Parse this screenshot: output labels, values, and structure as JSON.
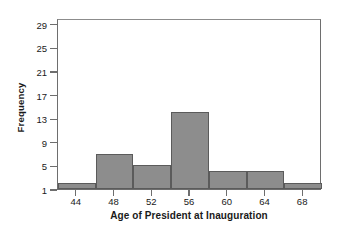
{
  "chart_data": {
    "type": "bar",
    "title": "",
    "xlabel": "Age of President at Inauguration",
    "ylabel": "Frequency",
    "bin_width": 4,
    "bin_edges": [
      42,
      46,
      50,
      54,
      58,
      62,
      66,
      70
    ],
    "categories": [
      "42-46",
      "46-50",
      "50-54",
      "54-58",
      "58-62",
      "62-66",
      "66-70"
    ],
    "bin_centers": [
      44,
      48,
      52,
      56,
      60,
      64,
      68
    ],
    "values": [
      2,
      7,
      5,
      14,
      4,
      4,
      2
    ],
    "xlim": [
      42,
      70
    ],
    "ylim": [
      1,
      30
    ],
    "xticks": [
      44,
      48,
      52,
      56,
      60,
      64,
      68
    ],
    "xtick_labels": [
      "44",
      "48",
      "52",
      "56",
      "60",
      "64",
      "68"
    ],
    "yticks": [
      1,
      5,
      9,
      13,
      17,
      21,
      25,
      29
    ],
    "ytick_labels": [
      "1",
      "5",
      "9",
      "13",
      "17",
      "21",
      "25",
      "29"
    ],
    "grid": false,
    "legend": null,
    "bar_fill_color": "#8d8d8d",
    "bar_edge_color": "#5b5b5b",
    "frame_color": "#6e6e6e",
    "background_color": "#ffffff",
    "text_color": "#1a1a1a"
  }
}
